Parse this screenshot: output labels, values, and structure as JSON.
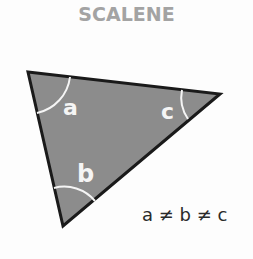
{
  "title": "SCALENE",
  "diagram": {
    "shape": "triangle",
    "fill": "#8c8c8c",
    "stroke": "#1a1a1a",
    "angle_labels": {
      "a": "a",
      "b": "b",
      "c": "c"
    },
    "equation": "a ≠ b ≠ c"
  }
}
